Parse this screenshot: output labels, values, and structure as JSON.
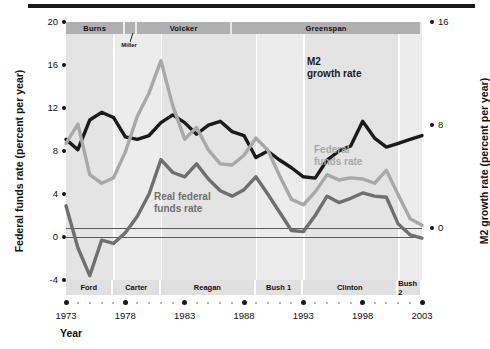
{
  "chart_data": {
    "type": "line",
    "title": "",
    "xlabel": "Year",
    "ylabel_left": "Federal funds rate (percent per year)",
    "ylabel_right": "M2 growth rate (percent per year)",
    "xlim": [
      1973,
      2003
    ],
    "ylim_left": [
      -4,
      20
    ],
    "ylim_right": [
      -4,
      16
    ],
    "yticks_left": [
      "20",
      "16",
      "12",
      "8",
      "4",
      "0",
      "-4"
    ],
    "yticks_left_values": [
      20,
      16,
      12,
      8,
      4,
      0,
      -4
    ],
    "yticks_right": [
      "16",
      "8",
      "0"
    ],
    "yticks_right_values": [
      16,
      8,
      0
    ],
    "xticks": [
      "1973",
      "1978",
      "1983",
      "1988",
      "1993",
      "1998",
      "2003"
    ],
    "xticks_values": [
      1973,
      1978,
      1983,
      1988,
      1993,
      1998,
      2003
    ],
    "grid": false,
    "legend_position": "inline-annotations",
    "x": [
      1973,
      1974,
      1975,
      1976,
      1977,
      1978,
      1979,
      1980,
      1981,
      1982,
      1983,
      1984,
      1985,
      1986,
      1987,
      1988,
      1989,
      1990,
      1991,
      1992,
      1993,
      1994,
      1995,
      1996,
      1997,
      1998,
      1999,
      2000,
      2001,
      2002,
      2003
    ],
    "series": [
      {
        "name": "M2 growth rate",
        "axis": "right",
        "color": "#1a1a1a",
        "values": [
          6.9,
          6.1,
          8.4,
          9.0,
          8.6,
          7.1,
          6.9,
          7.2,
          8.2,
          8.8,
          8.2,
          7.3,
          8.0,
          8.3,
          7.5,
          7.2,
          5.5,
          6.0,
          5.3,
          4.7,
          4.0,
          3.9,
          5.3,
          6.0,
          6.4,
          8.3,
          7.0,
          6.3,
          6.6,
          6.9,
          7.2
        ]
      },
      {
        "name": "Federal funds rate",
        "axis": "left",
        "color": "#a8a8a8",
        "values": [
          8.7,
          10.5,
          5.8,
          5.0,
          5.5,
          7.9,
          11.2,
          13.4,
          16.4,
          12.2,
          9.1,
          10.2,
          8.1,
          6.8,
          6.7,
          7.6,
          9.2,
          8.1,
          5.7,
          3.5,
          3.0,
          4.2,
          5.8,
          5.3,
          5.5,
          5.4,
          5.0,
          6.2,
          3.9,
          1.7,
          1.1
        ]
      },
      {
        "name": "Real federal funds rate",
        "axis": "left",
        "color": "#6f6f6f",
        "values": [
          2.9,
          -1.0,
          -3.6,
          -0.3,
          -0.6,
          0.4,
          1.9,
          4.0,
          7.2,
          6.0,
          5.6,
          6.8,
          5.4,
          4.3,
          3.8,
          4.4,
          5.6,
          4.0,
          2.3,
          0.6,
          0.5,
          2.0,
          3.8,
          3.2,
          3.6,
          4.1,
          3.8,
          3.7,
          1.2,
          0.2,
          -0.1
        ]
      }
    ],
    "annotations": [
      {
        "name": "m2-label",
        "text_line1": "M2",
        "text_line2": "growth rate"
      },
      {
        "name": "ff-label",
        "text_line1": "Federal",
        "text_line2": "funds rate"
      },
      {
        "name": "rff-label",
        "text_line1": "Real federal",
        "text_line2": "funds rate"
      }
    ],
    "fed_chairmen": [
      {
        "name": "Burns",
        "start": 1973,
        "end": 1978
      },
      {
        "name": "Miller",
        "start": 1978,
        "end": 1979
      },
      {
        "name": "Volcker",
        "start": 1979,
        "end": 1987
      },
      {
        "name": "Greenspan",
        "start": 1987,
        "end": 2003
      }
    ],
    "presidents": [
      {
        "name": "Ford",
        "start": 1973,
        "end": 1977
      },
      {
        "name": "Carter",
        "start": 1977,
        "end": 1981
      },
      {
        "name": "Reagan",
        "start": 1981,
        "end": 1989
      },
      {
        "name": "Bush 1",
        "start": 1989,
        "end": 1993
      },
      {
        "name": "Clinton",
        "start": 1993,
        "end": 2001
      },
      {
        "name": "Bush 2",
        "start": 2001,
        "end": 2003
      }
    ]
  }
}
